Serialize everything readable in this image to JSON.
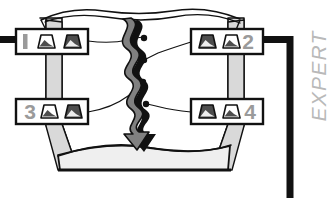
{
  "diagram": {
    "title_label": "EXPERT",
    "background_color": "#ffffff",
    "ink_color": "#111111",
    "terrain_fill": "#d9d9d9",
    "terrain_floor_fill": "#eeeeee",
    "arrow_fill": "#808080",
    "arrow_shadow": "#111111",
    "number_color": "#9a9a9a",
    "icon_dark_fill": "#4d4d4d",
    "icon_light_fill": "#ffffff",
    "callouts": [
      {
        "id": "callout-1",
        "number": "1",
        "number_side": "left",
        "icons": [
          "mountain-light-icon",
          "mountain-dark-icon"
        ],
        "x": 16,
        "y": 29,
        "width": 72,
        "height": 25
      },
      {
        "id": "callout-2",
        "number": "2",
        "number_side": "right",
        "icons": [
          "mountain-dark-icon",
          "mountain-light-icon"
        ],
        "x": 191,
        "y": 29,
        "width": 72,
        "height": 25
      },
      {
        "id": "callout-3",
        "number": "3",
        "number_side": "left",
        "icons": [
          "mountain-light-icon",
          "mountain-dark-icon"
        ],
        "x": 16,
        "y": 99,
        "width": 72,
        "height": 25
      },
      {
        "id": "callout-4",
        "number": "4",
        "number_side": "right",
        "icons": [
          "mountain-dark-icon",
          "mountain-light-icon"
        ],
        "x": 191,
        "y": 99,
        "width": 72,
        "height": 25
      }
    ],
    "connector_dots": 4,
    "center_arrow": {
      "name": "wavy-down-arrow",
      "direction": "down"
    },
    "frame_rule": {
      "left_bar": true,
      "right_corner_bar": true
    }
  }
}
